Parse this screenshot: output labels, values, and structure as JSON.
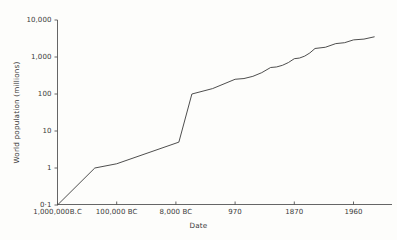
{
  "chart_data": {
    "type": "line",
    "title": "",
    "xlabel": "Date",
    "ylabel": "World population (millions)",
    "yscale": "log",
    "ylim": [
      0.1,
      10000
    ],
    "grid": false,
    "legend": "none",
    "ytick_labels": [
      "10,000",
      "1,000",
      "100",
      "10",
      "1",
      "0·1"
    ],
    "ytick_values": [
      10000,
      1000,
      100,
      10,
      1,
      0.1
    ],
    "xtick_labels": [
      "1,000,000B.C",
      "100,000 BC",
      "8,000 BC",
      "970",
      "1870",
      "1960"
    ],
    "categories": [
      "1,000,000B.C",
      "100,000 BC",
      "8,000 BC",
      "970",
      "1870",
      "1960"
    ],
    "series": [
      {
        "name": "World population",
        "points": [
          {
            "x": "1,000,000B.C",
            "slot": 0.0,
            "y": 0.1
          },
          {
            "x": "",
            "slot": 0.63,
            "y": 1.0
          },
          {
            "x": "100,000 BC",
            "slot": 1.0,
            "y": 1.3
          },
          {
            "x": "",
            "slot": 2.05,
            "y": 5.0
          },
          {
            "x": "8,000 BC",
            "slot": 2.27,
            "y": 100
          },
          {
            "x": "",
            "slot": 2.62,
            "y": 140
          },
          {
            "x": "970",
            "slot": 3.0,
            "y": 250
          },
          {
            "x": "",
            "slot": 3.6,
            "y": 520
          },
          {
            "x": "1870",
            "slot": 4.0,
            "y": 900
          },
          {
            "x": "",
            "slot": 4.35,
            "y": 1700
          },
          {
            "x": "",
            "slot": 4.7,
            "y": 2300
          },
          {
            "x": "1960",
            "slot": 5.0,
            "y": 2900
          },
          {
            "x": "",
            "slot": 5.35,
            "y": 3500
          }
        ]
      }
    ]
  },
  "axes": {
    "y_title": "World population (millions)",
    "x_title": "Date",
    "y_ticks": [
      {
        "label": "10,000"
      },
      {
        "label": "1,000"
      },
      {
        "label": "100"
      },
      {
        "label": "10"
      },
      {
        "label": "1"
      },
      {
        "label": "0·1"
      }
    ],
    "x_ticks": [
      {
        "label": "1,000,000B.C"
      },
      {
        "label": "100,000 BC"
      },
      {
        "label": "8,000 BC"
      },
      {
        "label": "970"
      },
      {
        "label": "1870"
      },
      {
        "label": "1960"
      }
    ]
  },
  "style": {
    "line_color": "#3a3a3a",
    "axis_color": "#555555",
    "background": "#fdfdfb"
  }
}
